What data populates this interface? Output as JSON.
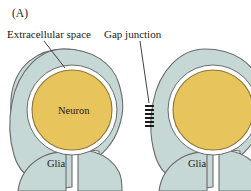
{
  "figure": {
    "panel_label": "(A)",
    "background_color": "#ffffff"
  },
  "labels": {
    "extracellular_space": "Extracellular space",
    "gap_junction": "Gap junction",
    "neuron": "Neuron",
    "glia_left": "Glia",
    "glia_right": "Glia"
  },
  "colors": {
    "glia_fill": "#c5d8d5",
    "glia_stroke": "#6b6b6b",
    "neuron_fill": "#e8c45c",
    "neuron_stroke": "#7a6a3a",
    "extracellular_fill": "#ffffff",
    "gap_junction_band": "#1a1a1a",
    "leader_line": "#2b2b2b",
    "text": "#1a1a1a"
  },
  "structures": {
    "cells": [
      {
        "name": "glia-cell-left",
        "neuron_label": "Neuron",
        "glia_label": "Glia",
        "cropped": false
      },
      {
        "name": "glia-cell-right",
        "neuron_label": "",
        "glia_label": "Glia",
        "cropped": true
      }
    ],
    "gap_junction": {
      "band_count": 6,
      "location": "between-left-and-right-glia-cells"
    }
  }
}
